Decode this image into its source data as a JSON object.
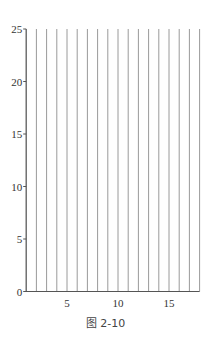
{
  "chart_data": {
    "type": "bar",
    "subtype": "vertical-lines",
    "title": "",
    "xlabel": "",
    "ylabel": "",
    "x": [
      1,
      2,
      3,
      4,
      5,
      6,
      7,
      8,
      9,
      10,
      11,
      12,
      13,
      14,
      15,
      16,
      17,
      18
    ],
    "values": [
      25,
      25,
      25,
      25,
      25,
      25,
      25,
      25,
      25,
      25,
      25,
      25,
      25,
      25,
      25,
      25,
      25,
      25
    ],
    "xlim": [
      1,
      18
    ],
    "ylim": [
      0,
      25
    ],
    "x_ticks": [
      5,
      10,
      15
    ],
    "y_ticks": [
      0,
      5,
      10,
      15,
      20,
      25
    ],
    "grid": false,
    "legend": null
  },
  "caption": "图 2-10",
  "colors": {
    "line": "#9a9a9a",
    "axis": "#555555",
    "text": "#333333"
  }
}
